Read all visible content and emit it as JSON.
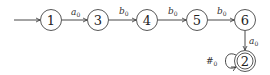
{
  "diagram": {
    "type": "finite-automaton",
    "start_state": "1",
    "accepting_states": [
      "2"
    ],
    "states": [
      {
        "id": "1",
        "label": "1",
        "x": 51,
        "y": 20,
        "accepting": false
      },
      {
        "id": "3",
        "label": "3",
        "x": 98,
        "y": 20,
        "accepting": false
      },
      {
        "id": "4",
        "label": "4",
        "x": 147,
        "y": 20,
        "accepting": false
      },
      {
        "id": "5",
        "label": "5",
        "x": 197,
        "y": 20,
        "accepting": false
      },
      {
        "id": "6",
        "label": "6",
        "x": 245,
        "y": 20,
        "accepting": false
      },
      {
        "id": "2",
        "label": "2",
        "x": 245,
        "y": 61,
        "accepting": true
      }
    ],
    "transitions": [
      {
        "from": "1",
        "to": "3",
        "symbol": "a",
        "sub": "0"
      },
      {
        "from": "3",
        "to": "4",
        "symbol": "b",
        "sub": "0"
      },
      {
        "from": "4",
        "to": "5",
        "symbol": "b",
        "sub": "0"
      },
      {
        "from": "5",
        "to": "6",
        "symbol": "b",
        "sub": "0"
      },
      {
        "from": "6",
        "to": "2",
        "symbol": "a",
        "sub": "0"
      },
      {
        "from": "2",
        "to": "2",
        "symbol": "#",
        "sub": "0"
      }
    ]
  }
}
